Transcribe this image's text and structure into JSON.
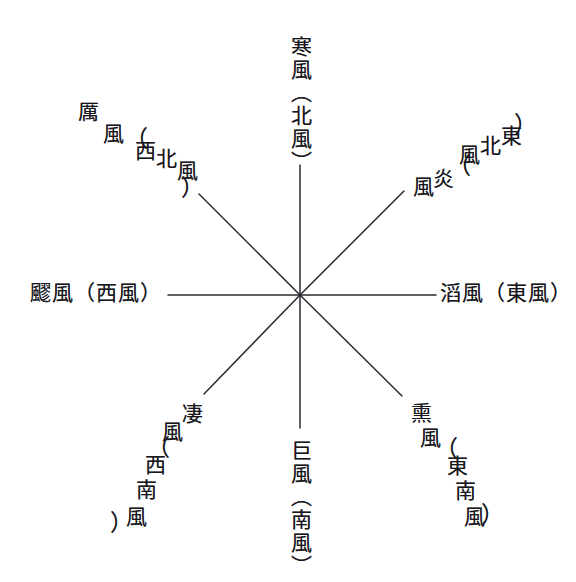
{
  "diagram": {
    "type": "eight-winds-compass-rose",
    "center": {
      "x": 300,
      "y": 295
    },
    "line_color": "#2a2a33",
    "text_color": "#17171c",
    "background": "#ffffff",
    "directions": [
      {
        "key": "north",
        "bearing_deg": 0,
        "wind_name": "寒風",
        "direction_name": "北風",
        "full_label": "寒風（北風）",
        "chars": [
          "寒",
          "風",
          "（",
          "北",
          "風",
          "）"
        ],
        "orientation": "vertical"
      },
      {
        "key": "northeast",
        "bearing_deg": 45,
        "wind_name": "炎風",
        "direction_name": "東北風",
        "full_label": "炎風（東北風）",
        "chars": [
          "風",
          "炎",
          "（",
          "風",
          "北",
          "東",
          "）"
        ],
        "orientation": "diagonal-up-right"
      },
      {
        "key": "east",
        "bearing_deg": 90,
        "wind_name": "滔風",
        "direction_name": "東風",
        "full_label": "滔風（東風）",
        "chars": [
          "滔",
          "風",
          "（",
          "東",
          "風",
          "）"
        ],
        "orientation": "horizontal"
      },
      {
        "key": "southeast",
        "bearing_deg": 135,
        "wind_name": "熏風",
        "direction_name": "東南風",
        "full_label": "熏風（東南風）",
        "chars": [
          "熏",
          "風",
          "（",
          "東",
          "南",
          "風",
          "）"
        ],
        "orientation": "diagonal-down-right"
      },
      {
        "key": "south",
        "bearing_deg": 180,
        "wind_name": "巨風",
        "direction_name": "南風",
        "full_label": "巨風（南風）",
        "chars": [
          "巨",
          "風",
          "（",
          "南",
          "風",
          "）"
        ],
        "orientation": "vertical"
      },
      {
        "key": "southwest",
        "bearing_deg": 225,
        "wind_name": "凄風",
        "direction_name": "西南風",
        "full_label": "凄風（西南風）",
        "chars": [
          "凄",
          "風",
          "（",
          "西",
          "南",
          "風",
          "）"
        ],
        "orientation": "diagonal-down-left"
      },
      {
        "key": "west",
        "bearing_deg": 270,
        "wind_name": "飂風",
        "direction_name": "西風",
        "full_label": "飂風（西風）",
        "chars": [
          "飂",
          "風",
          "（",
          "西",
          "風",
          "）"
        ],
        "orientation": "horizontal"
      },
      {
        "key": "northwest",
        "bearing_deg": 315,
        "wind_name": "厲風",
        "direction_name": "西北風",
        "full_label": "厲風（西北風）",
        "chars": [
          "厲",
          "風",
          "（",
          "西",
          "北",
          "風",
          "）"
        ],
        "orientation": "diagonal-up-left"
      }
    ]
  }
}
